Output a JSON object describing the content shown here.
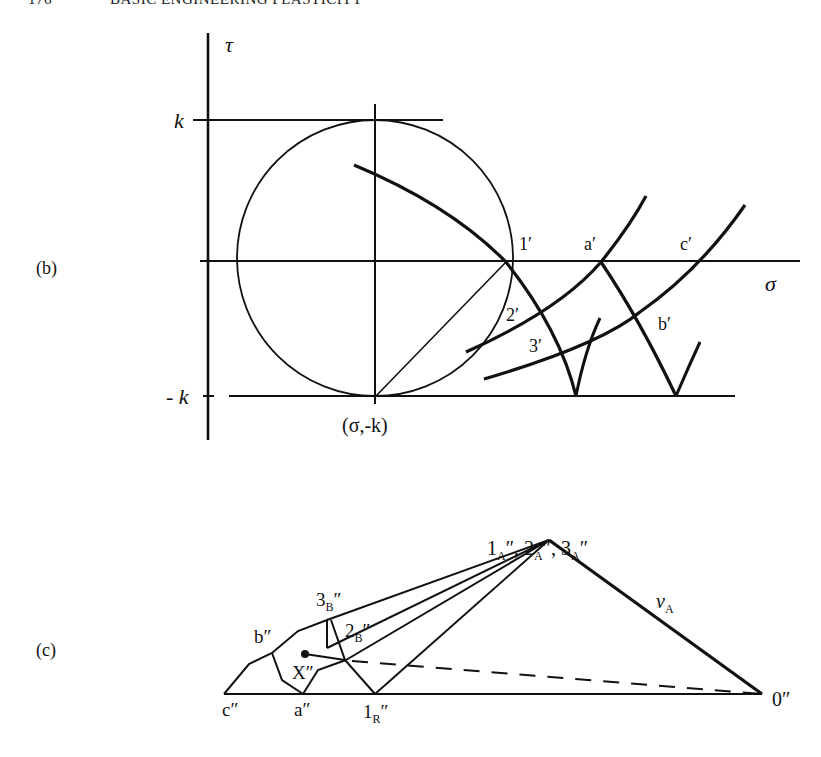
{
  "header": {
    "page_number": "176",
    "running_title": "BASIC ENGINEERING PLASTICITY"
  },
  "panel_b": {
    "panel_label": "(b)",
    "axis_tau": "τ",
    "axis_sigma": "σ",
    "k_label": "k",
    "neg_k_label": "- k",
    "pole_label": "(σ,-k)",
    "point_labels": {
      "p1": "1′",
      "p2": "2′",
      "p3": "3′",
      "a": "a′",
      "b": "b′",
      "c": "c′"
    }
  },
  "panel_c": {
    "panel_label": "(c)",
    "apex_label": {
      "n1": "1",
      "n2": "2",
      "n3": "3",
      "sub": "A",
      "prime": "″",
      "sep": ", "
    },
    "three_b": {
      "num": "3",
      "sub": "B",
      "prime": "″"
    },
    "two_b": {
      "num": "2",
      "sub": "B",
      "prime": "″"
    },
    "one_r": {
      "num": "1",
      "sub": "R",
      "prime": "″"
    },
    "b_label": "b″",
    "c_label": "c″",
    "a_label": "a″",
    "x_label": "X″",
    "origin_label": "0″",
    "velocity_label": {
      "main": "ν",
      "sub": "A"
    }
  }
}
